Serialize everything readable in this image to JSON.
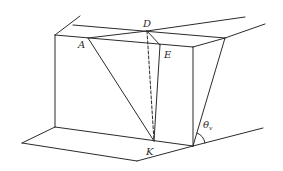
{
  "diagram": {
    "type": "geometry-3d-block",
    "labels": {
      "D": "D",
      "A": "A",
      "E": "E",
      "K": "K",
      "theta": "θ",
      "theta_sub": "v"
    }
  }
}
